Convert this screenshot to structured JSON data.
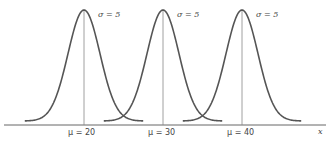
{
  "chart_data": {
    "type": "line",
    "title": "",
    "xlabel": "x",
    "ylabel": "",
    "grid": false,
    "series": [
      {
        "name": "μ = 20, σ = 5",
        "mean": 20,
        "sd": 5
      },
      {
        "name": "μ = 30, σ = 5",
        "mean": 30,
        "sd": 5
      },
      {
        "name": "μ = 40, σ = 5",
        "mean": 40,
        "sd": 5
      }
    ],
    "annotations": [
      "σ = 5",
      "σ = 5",
      "σ = 5",
      "μ = 20",
      "μ = 30",
      "μ = 40",
      "x"
    ]
  },
  "curves": [
    {
      "sigma_label": "σ = 5",
      "mu_label": "μ = 20",
      "center_px": 84
    },
    {
      "sigma_label": "σ = 5",
      "mu_label": "μ = 30",
      "center_px": 163
    },
    {
      "sigma_label": "σ = 5",
      "mu_label": "μ = 40",
      "center_px": 242
    }
  ],
  "axis": {
    "label": "x"
  },
  "colors": {
    "curve": "#555555",
    "axis": "#666666",
    "mean_line": "#888888",
    "text": "#444444"
  }
}
